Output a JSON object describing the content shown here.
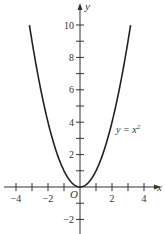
{
  "chart_data": {
    "type": "line",
    "title": "",
    "function": "y = x^2",
    "xlabel": "x",
    "ylabel": "y",
    "origin_label": "O",
    "xlim": [
      -4.5,
      5
    ],
    "ylim": [
      -3,
      11
    ],
    "x_ticks": [
      -4,
      -3,
      -2,
      -1,
      0,
      1,
      2,
      3,
      4
    ],
    "x_tick_labels": [
      {
        "value": -4,
        "label": "−4"
      },
      {
        "value": -2,
        "label": "−2"
      },
      {
        "value": 2,
        "label": "2"
      },
      {
        "value": 4,
        "label": "4"
      }
    ],
    "y_ticks": [
      -2,
      -1,
      1,
      2,
      3,
      4,
      5,
      6,
      7,
      8,
      9,
      10
    ],
    "y_tick_labels": [
      {
        "value": 10,
        "label": "10"
      },
      {
        "value": 8,
        "label": "8"
      },
      {
        "value": 6,
        "label": "6"
      },
      {
        "value": 4,
        "label": "4"
      },
      {
        "value": 2,
        "label": "2"
      },
      {
        "value": -2,
        "label": "−2"
      }
    ],
    "grid": false,
    "series": [
      {
        "name": "y = x²",
        "x": [
          -3.16,
          -3,
          -2.5,
          -2,
          -1.5,
          -1,
          -0.5,
          0,
          0.5,
          1,
          1.5,
          2,
          2.5,
          3,
          3.16
        ],
        "values": [
          10,
          9,
          6.25,
          4,
          2.25,
          1,
          0.25,
          0,
          0.25,
          1,
          2.25,
          4,
          6.25,
          9,
          10
        ],
        "color": "#222222"
      }
    ],
    "annotations": [
      {
        "text": "y = x",
        "superscript": "2",
        "x": 2.1,
        "y": 4.8
      }
    ]
  },
  "colors": {
    "axis": "#333333",
    "curve": "#222222",
    "background": "#ffffff"
  }
}
